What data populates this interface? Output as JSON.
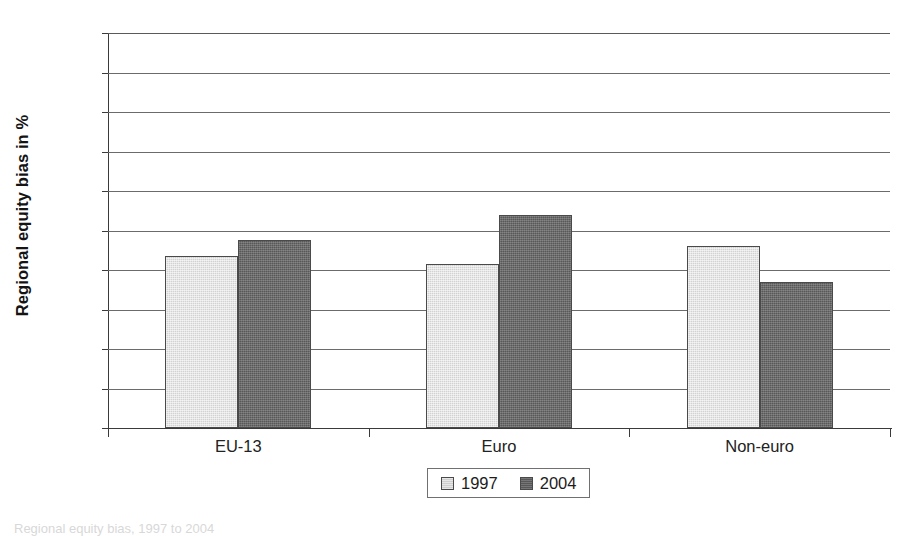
{
  "chart_data": {
    "type": "bar",
    "title": "",
    "xlabel": "",
    "ylabel": "Regional equity bias in %",
    "categories": [
      "EU-13",
      "Euro",
      "Non-euro"
    ],
    "series": [
      {
        "name": "1997",
        "values": [
          43.5,
          41.5,
          46.0
        ],
        "color": "#d2d2d2"
      },
      {
        "name": "2004",
        "values": [
          47.5,
          54.0,
          37.0
        ],
        "color": "#585858"
      }
    ],
    "ylim": [
      0,
      100
    ],
    "ytick_labels": [
      "0%",
      "10%",
      "20%",
      "30%",
      "40%",
      "50%",
      "60%",
      "70%",
      "80%",
      "90%",
      "100%"
    ],
    "ytick_values": [
      0,
      10,
      20,
      30,
      40,
      50,
      60,
      70,
      80,
      90,
      100
    ],
    "grid": true,
    "legend_position": "bottom-center"
  },
  "legend": {
    "entries": [
      {
        "label": "1997"
      },
      {
        "label": "2004"
      }
    ]
  },
  "caption": {
    "text": "Regional equity bias, 1997 to 2004"
  }
}
